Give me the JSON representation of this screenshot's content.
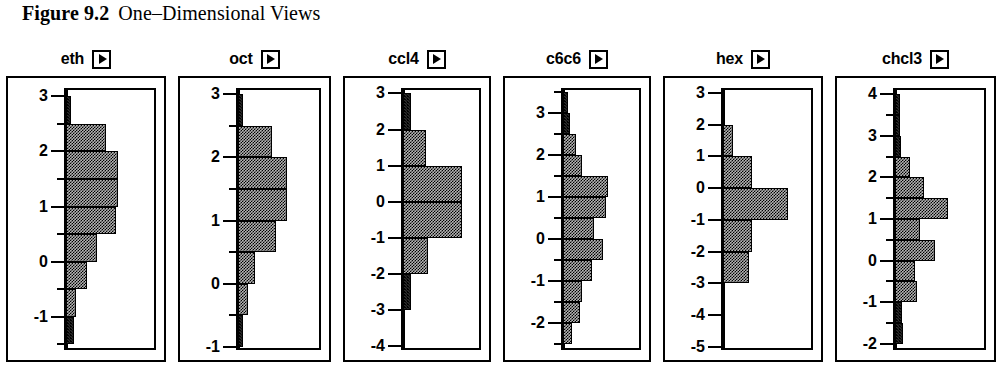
{
  "caption": {
    "figure_label": "Figure 9.2",
    "title": "One–Dimensional Views"
  },
  "panels": [
    {
      "name": "eth",
      "arrow_icon": "play-triangle-icon",
      "axis": {
        "major_ticks": [
          3,
          2,
          1,
          0,
          -1
        ],
        "minor_ticks": [
          2.5,
          1.5,
          0.5,
          -0.5,
          -1.5
        ],
        "top": 3.15,
        "bottom": -1.6
      }
    },
    {
      "name": "oct",
      "arrow_icon": "play-triangle-icon",
      "axis": {
        "major_ticks": [
          3,
          2,
          1,
          0,
          -1
        ],
        "minor_ticks": [
          2.5,
          1.5,
          0.5,
          -0.5
        ],
        "top": 3.1,
        "bottom": -1.05
      }
    },
    {
      "name": "ccl4",
      "arrow_icon": "play-triangle-icon",
      "axis": {
        "major_ticks": [
          3,
          2,
          1,
          0,
          -1,
          -2,
          -3,
          -4
        ],
        "minor_ticks": [],
        "top": 3.15,
        "bottom": -4.1
      }
    },
    {
      "name": "c6c6",
      "arrow_icon": "play-triangle-icon",
      "axis": {
        "major_ticks": [
          3,
          2,
          1,
          0,
          -1,
          -2
        ],
        "minor_ticks": [
          3.5,
          2.5,
          1.5,
          0.5,
          -0.5,
          -1.5,
          -2.5
        ],
        "top": 3.6,
        "bottom": -2.65
      }
    },
    {
      "name": "hex",
      "arrow_icon": "play-triangle-icon",
      "axis": {
        "major_ticks": [
          3,
          2,
          1,
          0,
          -1,
          -2,
          -3,
          -4,
          -5
        ],
        "minor_ticks": [],
        "top": 3.15,
        "bottom": -5.1
      }
    },
    {
      "name": "chcl3",
      "arrow_icon": "play-triangle-icon",
      "axis": {
        "major_ticks": [
          4,
          3,
          2,
          1,
          0,
          -1,
          -2
        ],
        "minor_ticks": [
          3.5,
          2.5,
          1.5,
          0.5,
          -0.5,
          -1.5
        ],
        "top": 4.15,
        "bottom": -2.15
      }
    }
  ],
  "chart_data": [
    {
      "type": "bar",
      "title": "eth",
      "orientation": "horizontal",
      "xlabel": "count",
      "ylabel": "eth",
      "ylim": [
        -1.6,
        3.15
      ],
      "xlim": [
        0,
        1
      ],
      "grid": false,
      "bins": [
        {
          "from": 3.0,
          "to": 2.5,
          "value": 0.04
        },
        {
          "from": 2.5,
          "to": 2.0,
          "value": 0.42
        },
        {
          "from": 2.0,
          "to": 1.5,
          "value": 0.55
        },
        {
          "from": 1.5,
          "to": 1.0,
          "value": 0.55
        },
        {
          "from": 1.0,
          "to": 0.5,
          "value": 0.53
        },
        {
          "from": 0.5,
          "to": 0.0,
          "value": 0.33
        },
        {
          "from": 0.0,
          "to": -0.5,
          "value": 0.22
        },
        {
          "from": -0.5,
          "to": -1.0,
          "value": 0.1
        },
        {
          "from": -1.0,
          "to": -1.5,
          "value": 0.08
        }
      ]
    },
    {
      "type": "bar",
      "title": "oct",
      "orientation": "horizontal",
      "xlabel": "count",
      "ylabel": "oct",
      "ylim": [
        -1.05,
        3.1
      ],
      "xlim": [
        0,
        1
      ],
      "grid": false,
      "bins": [
        {
          "from": 3.0,
          "to": 2.5,
          "value": 0.04
        },
        {
          "from": 2.5,
          "to": 2.0,
          "value": 0.36
        },
        {
          "from": 2.0,
          "to": 1.5,
          "value": 0.52
        },
        {
          "from": 1.5,
          "to": 1.0,
          "value": 0.52
        },
        {
          "from": 1.0,
          "to": 0.5,
          "value": 0.4
        },
        {
          "from": 0.5,
          "to": 0.0,
          "value": 0.18
        },
        {
          "from": 0.0,
          "to": -0.5,
          "value": 0.11
        },
        {
          "from": -0.5,
          "to": -1.0,
          "value": 0.03
        }
      ]
    },
    {
      "type": "bar",
      "title": "ccl4",
      "orientation": "horizontal",
      "xlabel": "count",
      "ylabel": "ccl4",
      "ylim": [
        -4.1,
        3.15
      ],
      "xlim": [
        0,
        1
      ],
      "grid": false,
      "bins": [
        {
          "from": 3.0,
          "to": 2.0,
          "value": 0.08
        },
        {
          "from": 2.0,
          "to": 1.0,
          "value": 0.24
        },
        {
          "from": 1.0,
          "to": 0.0,
          "value": 0.62
        },
        {
          "from": 0.0,
          "to": -1.0,
          "value": 0.62
        },
        {
          "from": -1.0,
          "to": -2.0,
          "value": 0.26
        },
        {
          "from": -2.0,
          "to": -3.0,
          "value": 0.08
        }
      ]
    },
    {
      "type": "bar",
      "title": "c6c6",
      "orientation": "horizontal",
      "xlabel": "count",
      "ylabel": "c6c6",
      "ylim": [
        -2.65,
        3.6
      ],
      "xlim": [
        0,
        1
      ],
      "grid": false,
      "bins": [
        {
          "from": 3.5,
          "to": 3.0,
          "value": 0.05
        },
        {
          "from": 3.0,
          "to": 2.5,
          "value": 0.07
        },
        {
          "from": 2.5,
          "to": 2.0,
          "value": 0.14
        },
        {
          "from": 2.0,
          "to": 1.5,
          "value": 0.2
        },
        {
          "from": 1.5,
          "to": 1.0,
          "value": 0.47
        },
        {
          "from": 1.0,
          "to": 0.5,
          "value": 0.45
        },
        {
          "from": 0.5,
          "to": 0.0,
          "value": 0.33
        },
        {
          "from": 0.0,
          "to": -0.5,
          "value": 0.42
        },
        {
          "from": -0.5,
          "to": -1.0,
          "value": 0.3
        },
        {
          "from": -1.0,
          "to": -1.5,
          "value": 0.2
        },
        {
          "from": -1.5,
          "to": -2.0,
          "value": 0.18
        },
        {
          "from": -2.0,
          "to": -2.5,
          "value": 0.09
        }
      ]
    },
    {
      "type": "bar",
      "title": "hex",
      "orientation": "horizontal",
      "xlabel": "count",
      "ylabel": "hex",
      "ylim": [
        -5.1,
        3.15
      ],
      "xlim": [
        0,
        1
      ],
      "grid": false,
      "bins": [
        {
          "from": 2.0,
          "to": 1.0,
          "value": 0.1
        },
        {
          "from": 1.0,
          "to": 0.0,
          "value": 0.3
        },
        {
          "from": 0.0,
          "to": -1.0,
          "value": 0.68
        },
        {
          "from": -1.0,
          "to": -2.0,
          "value": 0.3
        },
        {
          "from": -2.0,
          "to": -3.0,
          "value": 0.27
        }
      ]
    },
    {
      "type": "bar",
      "title": "chcl3",
      "orientation": "horizontal",
      "xlabel": "count",
      "ylabel": "chcl3",
      "ylim": [
        -2.15,
        4.15
      ],
      "xlim": [
        0,
        1
      ],
      "grid": false,
      "bins": [
        {
          "from": 4.0,
          "to": 3.5,
          "value": 0.04
        },
        {
          "from": 3.5,
          "to": 3.0,
          "value": 0.04
        },
        {
          "from": 3.0,
          "to": 2.5,
          "value": 0.06
        },
        {
          "from": 2.5,
          "to": 2.0,
          "value": 0.16
        },
        {
          "from": 2.0,
          "to": 1.5,
          "value": 0.3
        },
        {
          "from": 1.5,
          "to": 1.0,
          "value": 0.56
        },
        {
          "from": 1.0,
          "to": 0.5,
          "value": 0.26
        },
        {
          "from": 0.5,
          "to": 0.0,
          "value": 0.42
        },
        {
          "from": 0.0,
          "to": -0.5,
          "value": 0.21
        },
        {
          "from": -0.5,
          "to": -1.0,
          "value": 0.23
        },
        {
          "from": -1.0,
          "to": -1.5,
          "value": 0.07
        },
        {
          "from": -1.5,
          "to": -2.0,
          "value": 0.08
        }
      ]
    }
  ]
}
